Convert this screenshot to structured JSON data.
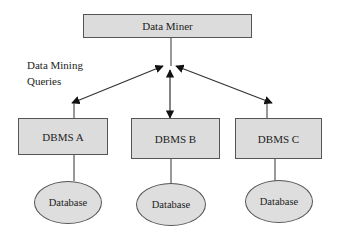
{
  "diagram": {
    "top_node": {
      "label": "Data Miner"
    },
    "annotation": {
      "line1": "Data Mining",
      "line2": "Queries"
    },
    "dbms_nodes": [
      {
        "label": "DBMS A",
        "database": "Database"
      },
      {
        "label": "DBMS B",
        "database": "Database"
      },
      {
        "label": "DBMS C",
        "database": "Database"
      }
    ],
    "colors": {
      "node_fill": "#dcdcdc",
      "stroke": "#333333"
    }
  }
}
